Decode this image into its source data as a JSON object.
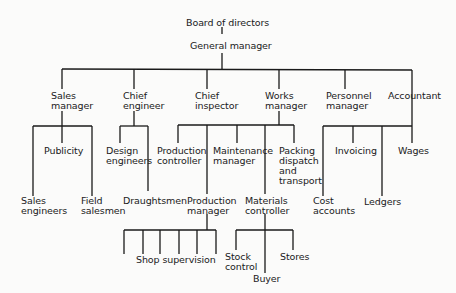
{
  "diagram": {
    "type": "organization-chart",
    "root": {
      "label": "Board of directors",
      "child": {
        "label": "General manager",
        "children": [
          {
            "label": "Sales manager",
            "children": [
              "Sales engineers",
              "Publicity",
              "Field salesmen"
            ]
          },
          {
            "label": "Chief engineer",
            "children": [
              "Design engineers",
              "Draughtsmen"
            ]
          },
          {
            "label": "Chief inspector",
            "children": []
          },
          {
            "label": "Works manager",
            "children": [
              "Production controller",
              {
                "label": "Production manager",
                "children": [
                  "Shop supervision"
                ]
              },
              "Maintenance manager",
              {
                "label": "Materials controller",
                "children": [
                  "Stock control",
                  "Buyer",
                  "Stores"
                ]
              },
              "Packing dispatch and transport"
            ]
          },
          {
            "label": "Personnel manager",
            "children": []
          },
          {
            "label": "Accountant",
            "children": [
              "Cost accounts",
              "Invoicing",
              "Ledgers",
              "Wages"
            ]
          }
        ]
      }
    }
  },
  "labels": {
    "board": "Board of directors",
    "gm": "General manager",
    "sales_mgr": [
      "Sales",
      "manager"
    ],
    "chief_eng": [
      "Chief",
      "engineer"
    ],
    "chief_insp": [
      "Chief",
      "inspector"
    ],
    "works_mgr": [
      "Works",
      "manager"
    ],
    "personnel_mgr": [
      "Personnel",
      "manager"
    ],
    "accountant": "Accountant",
    "publicity": "Publicity",
    "sales_eng": [
      "Sales",
      "engineers"
    ],
    "field_sales": [
      "Field",
      "salesmen"
    ],
    "design_eng": [
      "Design",
      "engineers"
    ],
    "draughtsmen": "Draughtsmen",
    "prod_ctrl": [
      "Production",
      "controller"
    ],
    "maint_mgr": [
      "Maintenance",
      "manager"
    ],
    "packing": [
      "Packing",
      "dispatch",
      "and",
      "transport"
    ],
    "prod_mgr": [
      "Production",
      "manager"
    ],
    "materials_ctrl": [
      "Materials",
      "controller"
    ],
    "shop_supervision": "Shop supervision",
    "stock_control": [
      "Stock",
      "control"
    ],
    "buyer": "Buyer",
    "stores": "Stores",
    "invoicing": "Invoicing",
    "wages": "Wages",
    "cost_accounts": [
      "Cost",
      "accounts"
    ],
    "ledgers": "Ledgers"
  }
}
